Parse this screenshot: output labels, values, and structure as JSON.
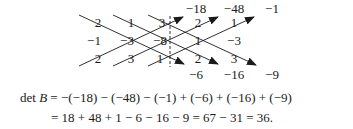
{
  "matrix": {
    "name": "B",
    "rows": [
      [
        "2",
        "1",
        "3"
      ],
      [
        "−1",
        "−3",
        "−8"
      ],
      [
        "2",
        "3",
        "1"
      ]
    ],
    "repeated_columns": [
      [
        "2",
        "1",
        "2"
      ],
      [
        "1",
        "−3",
        "3"
      ]
    ]
  },
  "products": {
    "top": [
      "−18",
      "−48",
      "−1"
    ],
    "bottom": [
      "−6",
      "−16",
      "−9"
    ]
  },
  "equation": {
    "line1_prefix": "det ",
    "line1_var": "B",
    "line1_rest": " = −(−18) − (−48) − (−1) + (−6) + (−16) + (−9)",
    "line2": "= 18 + 48 + 1 − 6 − 16 − 9 = 67 − 31 = 36."
  },
  "colors": {
    "ink": "#1a1a1a"
  }
}
